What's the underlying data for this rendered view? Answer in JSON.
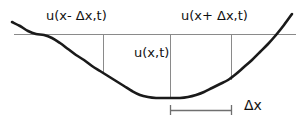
{
  "figure": {
    "labels": {
      "left": "u(x- Δx,t)",
      "center": "u(x,t)",
      "right": "u(x+ Δx,t)",
      "spacing": "Δx"
    },
    "colors": {
      "curve": "#1a1a1a",
      "reference_line": "#8a8a8a",
      "tick_line": "#8a8a8a",
      "measure_bar": "#6f6f6f",
      "text": "#111111",
      "background": "#ffffff"
    }
  },
  "chart_data": {
    "type": "line",
    "title": "",
    "xlabel": "",
    "ylabel": "",
    "xlim": [
      0,
      304
    ],
    "ylim": [
      126,
      0
    ],
    "grid": false,
    "legend": null,
    "reference_line": {
      "y": 34,
      "x_start": 14,
      "x_end": 296
    },
    "sample_points": [
      {
        "name": "u(x- Δx,t)",
        "x": 103,
        "y_curve": 72
      },
      {
        "name": "u(x,t)",
        "x": 170,
        "y_curve": 98
      },
      {
        "name": "u(x+ Δx,t)",
        "x": 231,
        "y_curve": 80
      }
    ],
    "spacing_bar": {
      "x_start": 170,
      "x_end": 232,
      "y": 110,
      "label": "Δx"
    },
    "curve_points": [
      [
        12,
        22
      ],
      [
        20,
        26
      ],
      [
        28,
        31
      ],
      [
        36,
        34
      ],
      [
        44,
        35
      ],
      [
        52,
        38
      ],
      [
        60,
        43
      ],
      [
        68,
        49
      ],
      [
        76,
        55
      ],
      [
        84,
        60
      ],
      [
        92,
        66
      ],
      [
        100,
        71
      ],
      [
        108,
        76
      ],
      [
        116,
        81
      ],
      [
        124,
        86
      ],
      [
        132,
        91
      ],
      [
        140,
        95
      ],
      [
        148,
        97
      ],
      [
        156,
        98
      ],
      [
        164,
        98
      ],
      [
        172,
        98
      ],
      [
        180,
        98
      ],
      [
        188,
        97
      ],
      [
        196,
        95
      ],
      [
        204,
        92
      ],
      [
        212,
        88
      ],
      [
        220,
        84
      ],
      [
        228,
        80
      ],
      [
        236,
        74
      ],
      [
        244,
        67
      ],
      [
        252,
        60
      ],
      [
        260,
        52
      ],
      [
        268,
        44
      ],
      [
        276,
        35
      ],
      [
        284,
        25
      ],
      [
        292,
        14
      ]
    ]
  }
}
